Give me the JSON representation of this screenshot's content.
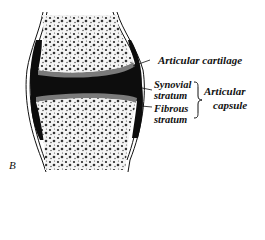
{
  "figure": {
    "letter": "B",
    "colors": {
      "ink": "#111111",
      "background": "#ffffff",
      "bone_fill": "#f2f2f2"
    }
  },
  "labels": {
    "articular_cartilage": "Articular  cartilage",
    "synovial": "Synovial",
    "synovial_stratum": "stratum",
    "fibrous": "Fibrous",
    "fibrous_stratum": "stratum",
    "articular": "Articular",
    "capsule": "capsule"
  }
}
